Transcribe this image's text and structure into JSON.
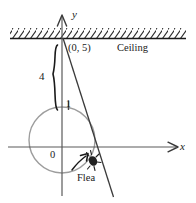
{
  "figure": {
    "labels": {
      "y_axis": "y",
      "x_axis": "x",
      "point": "(0, 5)",
      "ceiling": "Ceiling",
      "brace_value": "4",
      "tick_one": "1",
      "origin": "0",
      "flea": "Flea"
    },
    "colors": {
      "ink": "#1a1a1a",
      "axis": "#555555",
      "wheel": "#9a9a9a",
      "background": "#ffffff"
    },
    "geometry": {
      "origin": {
        "x": 62,
        "y": 147
      },
      "wheel": {
        "cx": 62,
        "cy": 140,
        "r": 33
      },
      "ceiling_y": 38,
      "x_axis": {
        "x1": 8,
        "x2": 186,
        "y": 147
      },
      "y_axis": {
        "x": 62,
        "y1": 14,
        "y2": 196
      },
      "slope_line": {
        "x1": 63,
        "y1": 38,
        "x2": 113,
        "y2": 196
      },
      "brace": {
        "x": 55,
        "y_top": 45,
        "y_bottom": 110
      },
      "flea_marker": {
        "x": 93,
        "y": 160
      }
    }
  }
}
